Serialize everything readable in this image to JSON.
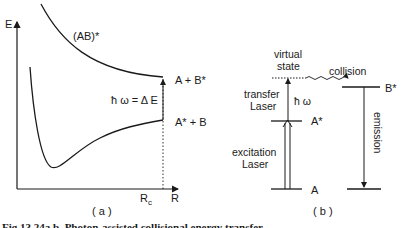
{
  "panel_a": {
    "axis_y_label": "E",
    "axis_x_label": "R",
    "x_marker_label": "R",
    "x_marker_sub": "c",
    "upper_curve_label": "(AB)*",
    "upper_asymptote_label": "A + B*",
    "lower_asymptote_label": "A* + B",
    "transition_label": "ħ ω = Δ E",
    "panel_label": "( a )"
  },
  "panel_b": {
    "virtual_state_label_line1": "virtual",
    "virtual_state_label_line2": "state",
    "collision_label": "collision",
    "transfer_laser_line1": "transfer",
    "transfer_laser_line2": "Laser",
    "photon_label": "ħ ω",
    "excitation_laser_line1": "excitation",
    "excitation_laser_line2": "Laser",
    "level_a_star": "A*",
    "level_a": "A",
    "level_b_star": "B*",
    "emission_label": "emission",
    "panel_label": "( b )"
  },
  "caption": "Fig.13.24a,b. Photon-assisted collisional energy transfer"
}
